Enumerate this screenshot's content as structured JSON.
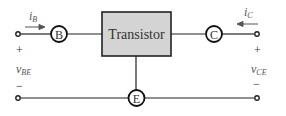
{
  "diagram": {
    "box_label": "Transistor",
    "terminals": {
      "base": "B",
      "collector": "C",
      "emitter": "E"
    },
    "currents": {
      "base": {
        "symbol": "i",
        "sub": "B"
      },
      "collector": {
        "symbol": "i",
        "sub": "C"
      }
    },
    "voltages": {
      "base_emitter": {
        "symbol": "v",
        "sub": "BE",
        "plus": "+",
        "minus": "−"
      },
      "collector_emitter": {
        "symbol": "v",
        "sub": "CE",
        "plus": "+",
        "minus": "−"
      }
    },
    "colors": {
      "box_fill": "#d4d4d4",
      "line": "#222222",
      "arrow": "#555555"
    }
  }
}
